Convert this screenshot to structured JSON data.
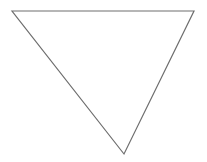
{
  "canvas": {
    "width": 207,
    "height": 162,
    "background_color": "#ffffff"
  },
  "figure": {
    "name": "downward-pointing-triangle",
    "label": "Triangle",
    "shape_type": "triangle",
    "orientation": "point-down",
    "fill_color": "#ffffff",
    "stroke_color": "#6e6e6e",
    "stroke_width": 1.2,
    "vertices": [
      {
        "name": "top-left-vertex",
        "x": 12,
        "y": 11
      },
      {
        "name": "top-right-vertex",
        "x": 194,
        "y": 11
      },
      {
        "name": "bottom-apex-vertex",
        "x": 124,
        "y": 154
      }
    ],
    "points_attr": "12,11 194,11 124,154"
  }
}
